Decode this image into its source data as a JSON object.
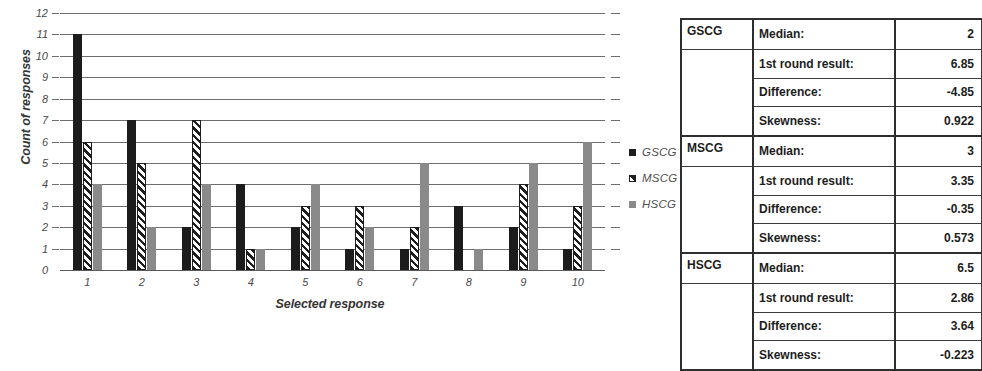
{
  "chart_data": {
    "type": "bar",
    "title": "",
    "xlabel": "Selected response",
    "ylabel": "Count of responses",
    "categories": [
      "1",
      "2",
      "3",
      "4",
      "5",
      "6",
      "7",
      "8",
      "9",
      "10"
    ],
    "ylim": [
      0,
      12
    ],
    "yticks": [
      0,
      1,
      2,
      3,
      4,
      5,
      6,
      7,
      8,
      9,
      10,
      11,
      12
    ],
    "grid": true,
    "legend_position": "right",
    "series": [
      {
        "name": "GSCG",
        "color": "#1c1c1c",
        "fill": "solid",
        "values": [
          11,
          7,
          2,
          4,
          2,
          1,
          1,
          3,
          2,
          1
        ]
      },
      {
        "name": "MSCG",
        "color": "#1e1e1e",
        "fill": "hatched",
        "values": [
          6,
          5,
          7,
          1,
          3,
          3,
          2,
          0,
          4,
          3
        ]
      },
      {
        "name": "HSCG",
        "color": "#8a8a8a",
        "fill": "solid",
        "values": [
          4,
          2,
          4,
          1,
          4,
          2,
          5,
          1,
          5,
          6
        ]
      }
    ]
  },
  "legend": {
    "items": [
      {
        "label": "GSCG",
        "swatch": "black-square-icon"
      },
      {
        "label": "MSCG",
        "swatch": "hatched-square-icon"
      },
      {
        "label": "HSCG",
        "swatch": "gray-square-icon"
      }
    ]
  },
  "stats_table": {
    "groups": [
      {
        "name": "GSCG",
        "rows": [
          {
            "label": "Median:",
            "value": "2"
          },
          {
            "label": "1st round result:",
            "value": "6.85"
          },
          {
            "label": "Difference:",
            "value": "-4.85"
          },
          {
            "label": "Skewness:",
            "value": "0.922"
          }
        ]
      },
      {
        "name": "MSCG",
        "rows": [
          {
            "label": "Median:",
            "value": "3"
          },
          {
            "label": "1st round result:",
            "value": "3.35"
          },
          {
            "label": "Difference:",
            "value": "-0.35"
          },
          {
            "label": "Skewness:",
            "value": "0.573"
          }
        ]
      },
      {
        "name": "HSCG",
        "rows": [
          {
            "label": "Median:",
            "value": "6.5"
          },
          {
            "label": "1st round result:",
            "value": "2.86"
          },
          {
            "label": "Difference:",
            "value": "3.64"
          },
          {
            "label": "Skewness:",
            "value": "-0.223"
          }
        ]
      }
    ]
  }
}
